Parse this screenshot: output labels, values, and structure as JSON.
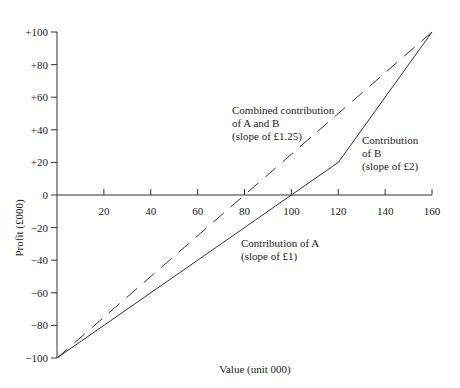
{
  "chart_data": {
    "type": "line",
    "title": "",
    "xlabel": "Value (unit 000)",
    "ylabel": "Profit (£000)",
    "xlim": [
      0,
      160
    ],
    "ylim": [
      -100,
      100
    ],
    "x_ticks": [
      "20",
      "40",
      "60",
      "80",
      "100",
      "120",
      "140",
      "160"
    ],
    "y_ticks": [
      "+100",
      "+80",
      "+60",
      "+40",
      "+20",
      "0",
      "−20",
      "−40",
      "−60",
      "−80",
      "−100"
    ],
    "grid": false,
    "series": [
      {
        "name": "Contribution of A and B (solid)",
        "style": "solid",
        "x": [
          0,
          120,
          160
        ],
        "y": [
          -100,
          20,
          100
        ]
      },
      {
        "name": "Combined contribution of A and B",
        "style": "dashed",
        "x": [
          0,
          160
        ],
        "y": [
          -100,
          100
        ]
      }
    ],
    "annotations": [
      {
        "lines": [
          "Combined contribution",
          "of A and B",
          "(slope of £1.25)"
        ]
      },
      {
        "lines": [
          "Contribution",
          "of B",
          "(slope of £2)"
        ]
      },
      {
        "lines": [
          "Contribution of A",
          "(slope of £1)"
        ]
      }
    ]
  }
}
